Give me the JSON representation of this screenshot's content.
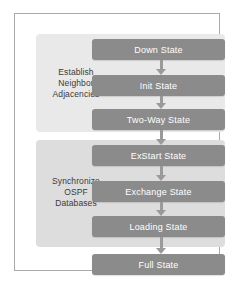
{
  "diagram": {
    "type": "flowchart",
    "groups": [
      {
        "id": "establish",
        "label": "Establish\nNeighbor\nAdjacencies",
        "label_lines": [
          "Establish",
          "Neighbor",
          "Adjacencies"
        ],
        "background_color": "#e9e9e9",
        "states": [
          "Down State",
          "Init State",
          "Two-Way State"
        ]
      },
      {
        "id": "synchronize",
        "label": "Synchronize\nOSPF\nDatabases",
        "label_lines": [
          "Synchronize",
          "OSPF",
          "Databases"
        ],
        "background_color": "#dddddd",
        "states": [
          "ExStart State",
          "Exchange State",
          "Loading State"
        ]
      }
    ],
    "states": [
      {
        "id": "down",
        "label": "Down State"
      },
      {
        "id": "init",
        "label": "Init State"
      },
      {
        "id": "two-way",
        "label": "Two-Way State"
      },
      {
        "id": "exstart",
        "label": "ExStart State"
      },
      {
        "id": "exchange",
        "label": "Exchange State"
      },
      {
        "id": "loading",
        "label": "Loading State"
      },
      {
        "id": "full",
        "label": "Full State"
      }
    ],
    "connectors": [
      {
        "from": "down",
        "to": "init",
        "icon": "arrow-down-icon"
      },
      {
        "from": "init",
        "to": "two-way",
        "icon": "arrow-down-icon"
      },
      {
        "from": "two-way",
        "to": "exstart",
        "icon": "arrow-down-icon"
      },
      {
        "from": "exstart",
        "to": "exchange",
        "icon": "arrow-down-icon"
      },
      {
        "from": "exchange",
        "to": "loading",
        "icon": "arrow-down-icon"
      },
      {
        "from": "loading",
        "to": "full",
        "icon": "arrow-down-icon"
      }
    ],
    "colors": {
      "state_box": "#8b8b8b",
      "state_text": "#ffffff",
      "arrow": "#9a9a9a",
      "frame_border": "#a9a9a9",
      "group_label_text": "#3a3a3a",
      "canvas": "#ffffff"
    }
  }
}
